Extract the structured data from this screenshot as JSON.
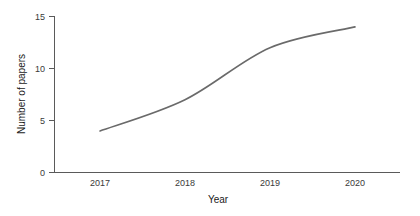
{
  "chart_data": {
    "type": "line",
    "title": "",
    "xlabel": "Year",
    "ylabel": "Number of papers",
    "x": [
      2017,
      2018,
      2019,
      2020
    ],
    "categories": [
      "2017",
      "2018",
      "2019",
      "2020"
    ],
    "values": [
      4,
      7,
      12,
      14
    ],
    "series": [
      {
        "name": "Number of papers",
        "values": [
          4,
          7,
          12,
          14
        ],
        "color": "#6a6a6a"
      }
    ],
    "xlim": [
      2017,
      2020
    ],
    "ylim": [
      0,
      15
    ],
    "ytick_labels": [
      "0",
      "5",
      "10",
      "15"
    ],
    "ytick_values": [
      0,
      5,
      10,
      15
    ],
    "xtick_labels": [
      "2017",
      "2018",
      "2019",
      "2020"
    ],
    "xtick_values": [
      2017,
      2018,
      2019,
      2020
    ],
    "grid": false,
    "legend": false,
    "legend_position": "none",
    "line_style": "solid",
    "markers": false,
    "curve_shape": "sigmoid-smoothed"
  },
  "axes": {
    "y": {
      "title": "Number of papers",
      "ticks": [
        {
          "label": "0"
        },
        {
          "label": "5"
        },
        {
          "label": "10"
        },
        {
          "label": "15"
        }
      ]
    },
    "x": {
      "title": "Year",
      "ticks": [
        {
          "label": "2017"
        },
        {
          "label": "2018"
        },
        {
          "label": "2019"
        },
        {
          "label": "2020"
        }
      ]
    }
  },
  "colors": {
    "line": "#6a6a6a",
    "axis": "#5a5a5a",
    "text": "#1a1a1a",
    "background": "#ffffff"
  }
}
